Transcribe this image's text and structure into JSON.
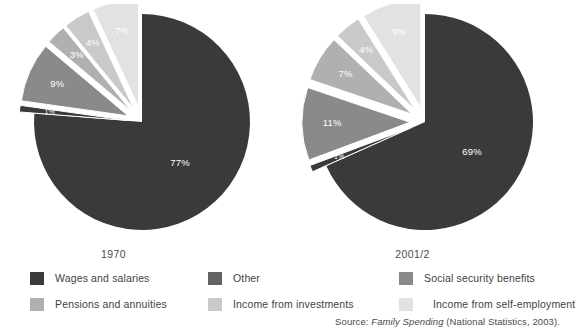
{
  "figure": {
    "source_prefix": "Source: ",
    "source_title": "Family Spending",
    "source_suffix": " (National Statistics, 2003)."
  },
  "colors": {
    "wages": "#3a3a3a",
    "other": "#636363",
    "social_security": "#8a8a8a",
    "pensions": "#b0b0b0",
    "investments": "#c9c9c9",
    "self_employment": "#e2e2e2",
    "background": "#ffffff",
    "label_light": "#ffffff",
    "label_dark": "#5e5e5e"
  },
  "legend": {
    "columns": [
      {
        "items": [
          {
            "label": "Wages and salaries",
            "color": "#3a3a3a",
            "key": "wages"
          },
          {
            "label": "Pensions and annuities",
            "color": "#b0b0b0",
            "key": "pensions"
          }
        ]
      },
      {
        "items": [
          {
            "label": "Other",
            "color": "#636363",
            "key": "other"
          },
          {
            "label": "Income from investments",
            "color": "#c9c9c9",
            "key": "investments"
          }
        ]
      },
      {
        "items": [
          {
            "label": "Social security benefits",
            "color": "#8a8a8a",
            "key": "social_security"
          },
          {
            "label": "Income from self-employment",
            "color": "#e2e2e2",
            "key": "self_employment"
          }
        ]
      }
    ]
  },
  "chart_data": [
    {
      "type": "pie",
      "title": "1970",
      "xlabel": "",
      "ylabel": "",
      "exploded": true,
      "legend_position": "bottom",
      "grid": false,
      "categories": [
        "Wages and salaries",
        "Other",
        "Income from investments",
        "Pensions and annuities",
        "Social security benefits",
        "Income from self-employment"
      ],
      "values": [
        77,
        1,
        9,
        3,
        4,
        7
      ],
      "labels": [
        "77%",
        "1%",
        "9%",
        "3%",
        "4%",
        "7%"
      ],
      "colors": [
        "#3a3a3a",
        "#3a3a3a",
        "#8a8a8a",
        "#b0b0b0",
        "#c9c9c9",
        "#e2e2e2"
      ]
    },
    {
      "type": "pie",
      "title": "2001/2",
      "xlabel": "",
      "ylabel": "",
      "exploded": true,
      "legend_position": "bottom",
      "grid": false,
      "categories": [
        "Wages and salaries",
        "Other",
        "Social security benefits",
        "Pensions and annuities",
        "Income from investments",
        "Income from self-employment"
      ],
      "values": [
        69,
        1,
        11,
        7,
        4,
        9
      ],
      "labels": [
        "69%",
        "1%",
        "11%",
        "7%",
        "4%",
        "9%"
      ],
      "colors": [
        "#3a3a3a",
        "#3a3a3a",
        "#8a8a8a",
        "#b0b0b0",
        "#c9c9c9",
        "#e2e2e2"
      ]
    }
  ]
}
